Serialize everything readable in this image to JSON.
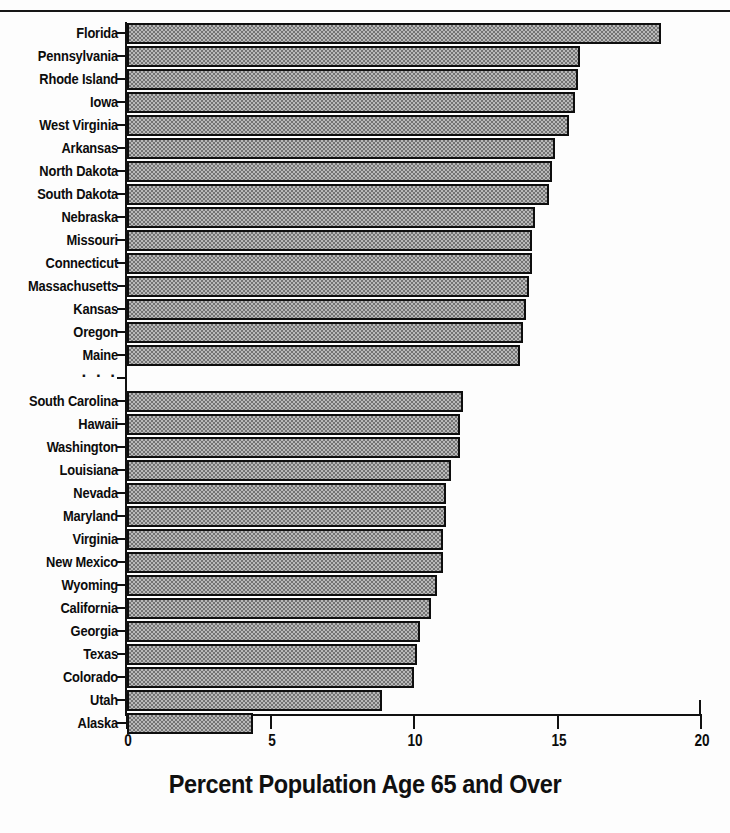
{
  "chart_data": {
    "type": "bar",
    "orientation": "horizontal",
    "title": "",
    "xlabel": "Percent Population Age 65 and Over",
    "ylabel": "",
    "xlim": [
      0,
      20
    ],
    "xticks": [
      0,
      5,
      10,
      15,
      20
    ],
    "xticklabels": [
      "0",
      "5",
      "10",
      "15",
      "20"
    ],
    "grid": false,
    "legend": null,
    "gap_marker": "· · ·",
    "gap_after_category": "Maine",
    "categories": [
      "Florida",
      "Pennsylvania",
      "Rhode Island",
      "Iowa",
      "West Virginia",
      "Arkansas",
      "North Dakota",
      "South Dakota",
      "Nebraska",
      "Missouri",
      "Connecticut",
      "Massachusetts",
      "Kansas",
      "Oregon",
      "Maine",
      "· · ·",
      "South Carolina",
      "Hawaii",
      "Washington",
      "Louisiana",
      "Nevada",
      "Maryland",
      "Virginia",
      "New Mexico",
      "Wyoming",
      "California",
      "Georgia",
      "Texas",
      "Colorado",
      "Utah",
      "Alaska"
    ],
    "values": [
      18.6,
      15.8,
      15.7,
      15.6,
      15.4,
      14.9,
      14.8,
      14.7,
      14.2,
      14.1,
      14.1,
      14.0,
      13.9,
      13.8,
      13.7,
      null,
      11.7,
      11.6,
      11.6,
      11.3,
      11.1,
      11.1,
      11.0,
      11.0,
      10.8,
      10.6,
      10.2,
      10.1,
      10.0,
      8.9,
      4.4
    ]
  },
  "axis": {
    "tick_labels": [
      "0",
      "5",
      "10",
      "15",
      "20"
    ],
    "title": "Percent Population Age 65 and Over"
  }
}
